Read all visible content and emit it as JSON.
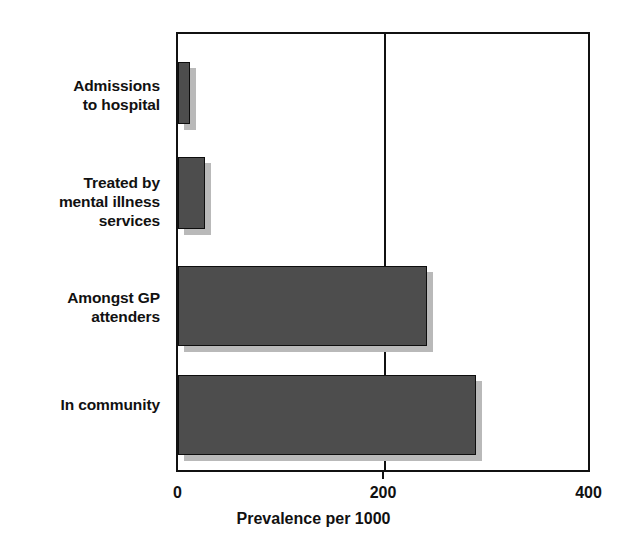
{
  "chart_data": {
    "type": "bar",
    "orientation": "horizontal",
    "title": "",
    "subtitle": "",
    "xlabel": "Prevalence per 1000",
    "ylabel": "",
    "categories": [
      "Admissions to hospital",
      "Treated by mental illness services",
      "Amongst GP attenders",
      "In community"
    ],
    "category_lines": [
      [
        "Admissions",
        "to hospital"
      ],
      [
        "Treated by",
        "mental illness",
        "services"
      ],
      [
        "Amongst GP",
        "attenders"
      ],
      [
        "In community"
      ]
    ],
    "values": [
      12,
      26,
      242,
      290
    ],
    "xlim": [
      0,
      400
    ],
    "xticks": [
      0,
      200,
      400
    ],
    "xtick_labels": [
      "0",
      "200",
      "400"
    ],
    "grid": "vertical-at-200",
    "legend": "none",
    "series": [
      {
        "name": "Prevalence per 1000",
        "values": [
          12,
          26,
          242,
          290
        ]
      }
    ],
    "colors": {
      "bar_fill": "#4d4d4d",
      "bar_border": "#0d0d0d",
      "bar_shadow": "#b9b9b9",
      "axis": "#111111",
      "background": "#ffffff",
      "text": "#111111"
    }
  }
}
